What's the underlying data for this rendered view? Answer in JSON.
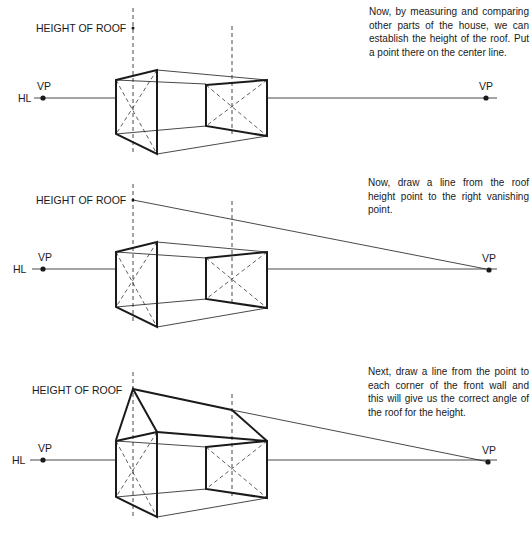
{
  "panels": [
    {
      "step": 1,
      "caption": "Now, by measuring and comparing other parts of the house, we can establish the height of the roof. Put a point there on the center line.",
      "labels": {
        "height_of_roof": "HEIGHT OF ROOF",
        "horizon_line": "HL",
        "left_vp": "VP",
        "right_vp": "VP"
      }
    },
    {
      "step": 2,
      "caption": "Now, draw a line from the roof height point to the right vanishing point.",
      "labels": {
        "height_of_roof": "HEIGHT OF ROOF",
        "horizon_line": "HL",
        "left_vp": "VP",
        "right_vp": "VP"
      }
    },
    {
      "step": 3,
      "caption": "Next, draw a line from the point to each corner of the front wall and this will give us the correct angle of the roof for the height.",
      "labels": {
        "height_of_roof": "HEIGHT OF ROOF",
        "horizon_line": "HL",
        "left_vp": "VP",
        "right_vp": "VP"
      }
    }
  ],
  "colors": {
    "ink": "#1a1a1a",
    "background": "#ffffff"
  }
}
